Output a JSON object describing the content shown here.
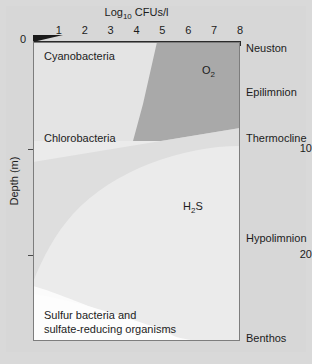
{
  "figure": {
    "background_color": "#d9d9d9",
    "plot_background_color": "#ebebeb"
  },
  "axis_title": "Log10 CFUs/l",
  "axis_title_base": "Log",
  "axis_title_sub": "10",
  "axis_title_rest": " CFUs/l",
  "y_axis_title": "Depth (m)",
  "zero_label": "0",
  "xticks": [
    {
      "label": "1",
      "value": 1
    },
    {
      "label": "2",
      "value": 2
    },
    {
      "label": "3",
      "value": 3
    },
    {
      "label": "4",
      "value": 4
    },
    {
      "label": "5",
      "value": 5
    },
    {
      "label": "6",
      "value": 6
    },
    {
      "label": "7",
      "value": 7
    },
    {
      "label": "8",
      "value": 8
    }
  ],
  "yticks": [
    {
      "label": "0",
      "value": 0
    },
    {
      "label": "10",
      "value": 10
    },
    {
      "label": "20",
      "value": 20
    }
  ],
  "plot_labels": {
    "cyanobacteria": "Cyanobacteria",
    "chlorobacteria": "Chlorobacteria",
    "oxygen_base": "O",
    "oxygen_sub": "2",
    "hydrogen_sulfide_base": "H",
    "hydrogen_sulfide_sub": "2",
    "hydrogen_sulfide_rest": "S",
    "sulfur_line1": "Sulfur bacteria and",
    "sulfur_line2": "sulfate-reducing organisms"
  },
  "zones": [
    {
      "name": "neuston",
      "label": "Neuston",
      "top": 42
    },
    {
      "name": "epilimnion",
      "label": "Epilimnion",
      "top": 86
    },
    {
      "name": "thermocline",
      "label": "Thermocline",
      "top": 132
    },
    {
      "name": "hypolimnion",
      "label": "Hypolimnion",
      "top": 232
    },
    {
      "name": "benthos",
      "label": "Benthos",
      "top": 332
    }
  ],
  "chart_data": {
    "type": "area",
    "title": "Log10 CFUs/l",
    "xlabel": "Log10 CFUs/l",
    "ylabel": "Depth (m)",
    "xlim": [
      0,
      8
    ],
    "ylim": [
      0,
      24
    ],
    "grid": false,
    "legend_position": "none",
    "regions": [
      {
        "name": "oxygen-zone",
        "label": "O2",
        "fill": "#a8a8a8",
        "zone": "epilimnion",
        "depth_range_m": [
          0,
          9.5
        ],
        "log_cfu_range": [
          4.3,
          8.0
        ],
        "boundary_points": [
          {
            "log_cfu": 4.8,
            "depth_m": 0.0
          },
          {
            "log_cfu": 4.3,
            "depth_m": 5.0
          },
          {
            "log_cfu": 3.9,
            "depth_m": 8.2
          },
          {
            "log_cfu": 8.0,
            "depth_m": 9.5
          }
        ]
      },
      {
        "name": "cyanobacteria-zone",
        "label": "Cyanobacteria",
        "fill": "#e3e3e3",
        "zone": "epilimnion",
        "depth_range_m": [
          0,
          9.5
        ],
        "log_cfu_range": [
          0,
          4.8
        ]
      },
      {
        "name": "chlorobacteria-zone",
        "label": "Chlorobacteria",
        "fill": "#dcdcdc",
        "zone": "thermocline",
        "depth_range_m": [
          9.0,
          10.5
        ],
        "log_cfu_range": [
          0,
          8.0
        ]
      },
      {
        "name": "hydrogen-sulfide-zone",
        "label": "H2S",
        "fill": "#ebebeb",
        "zone": "hypolimnion",
        "depth_range_m": [
          10.5,
          23.0
        ],
        "log_cfu_range": [
          0,
          8.0
        ],
        "boundary_points": [
          {
            "log_cfu": 8.0,
            "depth_m": 10.2
          },
          {
            "log_cfu": 2.2,
            "depth_m": 13.5
          },
          {
            "log_cfu": 1.0,
            "depth_m": 19.5
          }
        ]
      },
      {
        "name": "sulfur-bacteria-zone",
        "label": "Sulfur bacteria and sulfate-reducing organisms",
        "fill": "#fbfbfb",
        "zone": "benthos",
        "depth_range_m": [
          20.5,
          24.0
        ],
        "log_cfu_range": [
          0,
          6.5
        ],
        "boundary_points": [
          {
            "log_cfu": 0.3,
            "depth_m": 21.0
          },
          {
            "log_cfu": 2.0,
            "depth_m": 22.0
          },
          {
            "log_cfu": 5.6,
            "depth_m": 23.2
          },
          {
            "log_cfu": 6.4,
            "depth_m": 24.0
          }
        ]
      }
    ]
  }
}
